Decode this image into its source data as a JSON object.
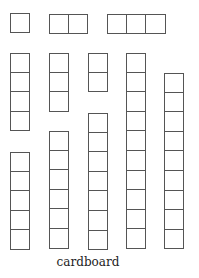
{
  "caption": "cardboard",
  "colors": {
    "line": "#555555",
    "background": "#ffffff"
  },
  "strips": [
    {
      "id": "strip-1h",
      "orientation": "horizontal",
      "cells": 1,
      "x": 10,
      "y": 13
    },
    {
      "id": "strip-2h",
      "orientation": "horizontal",
      "cells": 2,
      "x": 49,
      "y": 14
    },
    {
      "id": "strip-3h",
      "orientation": "horizontal",
      "cells": 3,
      "x": 107,
      "y": 14
    },
    {
      "id": "strip-4v",
      "orientation": "vertical",
      "cells": 4,
      "x": 10,
      "y": 53
    },
    {
      "id": "strip-3v",
      "orientation": "vertical",
      "cells": 3,
      "x": 49,
      "y": 53
    },
    {
      "id": "strip-2v",
      "orientation": "vertical",
      "cells": 2,
      "x": 88,
      "y": 53
    },
    {
      "id": "strip-10v",
      "orientation": "vertical",
      "cells": 10,
      "x": 126,
      "y": 53
    },
    {
      "id": "strip-9v",
      "orientation": "vertical",
      "cells": 9,
      "x": 164,
      "y": 73
    },
    {
      "id": "strip-7v",
      "orientation": "vertical",
      "cells": 7,
      "x": 88,
      "y": 113
    },
    {
      "id": "strip-6v",
      "orientation": "vertical",
      "cells": 6,
      "x": 49,
      "y": 131
    },
    {
      "id": "strip-5v",
      "orientation": "vertical",
      "cells": 5,
      "x": 10,
      "y": 152
    }
  ]
}
